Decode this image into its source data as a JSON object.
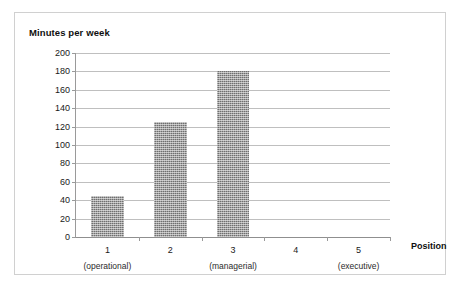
{
  "chart_data": {
    "type": "bar",
    "title": "Minutes per week",
    "xlabel": "Position",
    "ylabel": "Minutes per week",
    "categories": [
      "1",
      "2",
      "3",
      "4",
      "5"
    ],
    "category_sublabels": [
      "(operational)",
      "",
      "(managerial)",
      "",
      "(executive)"
    ],
    "values": [
      45,
      125,
      180,
      0,
      0
    ],
    "ylim": [
      0,
      200
    ],
    "ytick_labels": [
      "0",
      "20",
      "40",
      "60",
      "80",
      "100",
      "120",
      "140",
      "160",
      "180",
      "200"
    ],
    "ytick_values": [
      0,
      20,
      40,
      60,
      80,
      100,
      120,
      140,
      160,
      180,
      200
    ],
    "grid": true,
    "legend": false,
    "bar_color": "#6f6f6f",
    "gridline_color": "#bfbfbf",
    "frame_color": "#d0d0d0"
  }
}
